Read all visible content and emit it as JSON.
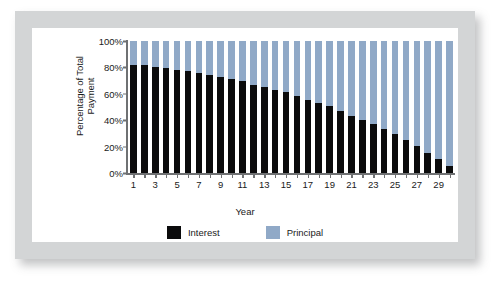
{
  "chart_data": {
    "type": "bar",
    "subtype": "stacked-100-percent",
    "title": "",
    "xlabel": "Year",
    "ylabel": "Percentage of Total Payment",
    "ylim": [
      0,
      100
    ],
    "ytick_labels": [
      "100%",
      "80%",
      "60%",
      "40%",
      "20%",
      "0%"
    ],
    "ytick_values": [
      100,
      80,
      60,
      40,
      20,
      0
    ],
    "grid": false,
    "legend_position": "bottom",
    "categories": [
      1,
      2,
      3,
      4,
      5,
      6,
      7,
      8,
      9,
      10,
      11,
      12,
      13,
      14,
      15,
      16,
      17,
      18,
      19,
      20,
      21,
      22,
      23,
      24,
      25,
      26,
      27,
      28,
      29,
      30
    ],
    "xtick_labels": [
      "1",
      "3",
      "5",
      "7",
      "9",
      "11",
      "13",
      "15",
      "17",
      "19",
      "21",
      "23",
      "25",
      "27",
      "29"
    ],
    "series": [
      {
        "name": "Interest",
        "color": "#0b0b0c",
        "values": [
          82,
          81.5,
          80.5,
          79.5,
          78,
          77,
          75.5,
          74.5,
          72.5,
          71,
          69.5,
          67,
          65,
          63,
          61,
          58.5,
          55.5,
          53,
          50.5,
          47,
          43.5,
          40.5,
          37,
          33.5,
          29.5,
          25,
          20.5,
          15.5,
          10.5,
          5
        ]
      },
      {
        "name": "Principal",
        "color": "#90a9c7",
        "values": [
          18,
          18.5,
          19.5,
          20.5,
          22,
          23,
          24.5,
          25.5,
          27.5,
          29,
          30.5,
          33,
          35,
          37,
          39,
          41.5,
          44.5,
          47,
          49.5,
          53,
          56.5,
          59.5,
          63,
          66.5,
          70.5,
          75,
          79.5,
          84.5,
          89.5,
          95
        ]
      }
    ]
  },
  "legend": {
    "items": [
      {
        "label": "Interest",
        "color": "#0b0b0c"
      },
      {
        "label": "Principal",
        "color": "#90a9c7"
      }
    ]
  },
  "theme": {
    "frame_color": "#d3d5d6",
    "card_color": "#ffffff",
    "axis_color": "#6f7173",
    "text_color": "#1a1a1a"
  }
}
